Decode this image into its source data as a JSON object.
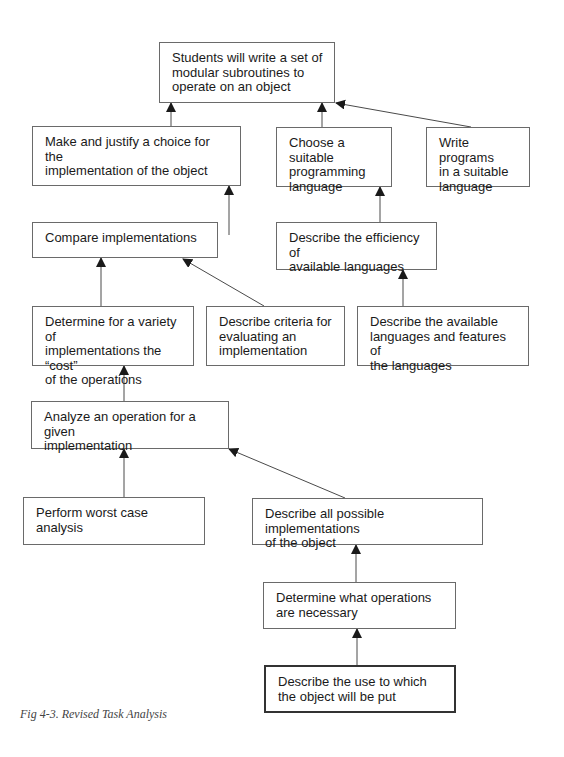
{
  "diagram": {
    "type": "task-analysis-hierarchy",
    "colors": {
      "line": "#4a4a4a",
      "border": "#6a6a6a",
      "text": "#1a1a1a"
    },
    "nodes": [
      {
        "id": "n0",
        "label": "Students will write a set of\nmodular subroutines to\noperate on an object",
        "x": 159,
        "y": 42,
        "w": 176,
        "h": 61
      },
      {
        "id": "n1",
        "label": "Make and justify a choice for the\nimplementation of the object",
        "x": 32,
        "y": 126,
        "w": 209,
        "h": 60
      },
      {
        "id": "n2",
        "label": "Choose a suitable\nprogramming\nlanguage",
        "x": 276,
        "y": 127,
        "w": 116,
        "h": 60
      },
      {
        "id": "n3",
        "label": "Write programs\nin a suitable\nlanguage",
        "x": 426,
        "y": 127,
        "w": 104,
        "h": 60
      },
      {
        "id": "n4",
        "label": "Compare implementations",
        "x": 32,
        "y": 222,
        "w": 186,
        "h": 36
      },
      {
        "id": "n5",
        "label": "Describe the efficiency of\navailable languages",
        "x": 276,
        "y": 222,
        "w": 161,
        "h": 48
      },
      {
        "id": "n6",
        "label": "Determine for a variety of\nimplementations the “cost”\nof the operations",
        "x": 32,
        "y": 306,
        "w": 162,
        "h": 60
      },
      {
        "id": "n7",
        "label": "Describe criteria for\nevaluating an\nimplementation",
        "x": 206,
        "y": 306,
        "w": 139,
        "h": 60
      },
      {
        "id": "n8",
        "label": "Describe the available\nlanguages and features of\nthe languages",
        "x": 357,
        "y": 306,
        "w": 172,
        "h": 60
      },
      {
        "id": "n9",
        "label": "Analyze an operation for a given\nimplementation",
        "x": 31,
        "y": 401,
        "w": 198,
        "h": 48
      },
      {
        "id": "n10",
        "label": "Perform worst case analysis",
        "x": 23,
        "y": 497,
        "w": 182,
        "h": 48
      },
      {
        "id": "n11",
        "label": "Describe all possible implementations\nof the object",
        "x": 252,
        "y": 498,
        "w": 231,
        "h": 47
      },
      {
        "id": "n12",
        "label": "Determine what operations\nare necessary",
        "x": 263,
        "y": 582,
        "w": 193,
        "h": 47
      },
      {
        "id": "n13",
        "label": "Describe the use to which\nthe object will be put",
        "x": 264,
        "y": 665,
        "w": 192,
        "h": 48,
        "emphasis": true
      }
    ],
    "edges": [
      {
        "from": "n1",
        "to": "n0",
        "x1": 171,
        "y1": 126,
        "x2": 171,
        "y2": 103
      },
      {
        "from": "n2",
        "to": "n0",
        "x1": 322,
        "y1": 127,
        "x2": 322,
        "y2": 103
      },
      {
        "from": "n3",
        "to": "n0",
        "x1": 471,
        "y1": 127,
        "x2": 336,
        "y2": 103
      },
      {
        "from": "n4",
        "to": "n1",
        "x1": 229,
        "y1": 235,
        "x2": 229,
        "y2": 186
      },
      {
        "from": "n5",
        "to": "n2",
        "x1": 380,
        "y1": 235,
        "x2": 380,
        "y2": 187
      },
      {
        "from": "n6",
        "to": "n4",
        "x1": 101,
        "y1": 306,
        "x2": 101,
        "y2": 258
      },
      {
        "from": "n7",
        "to": "n4",
        "x1": 264,
        "y1": 306,
        "x2": 183,
        "y2": 259
      },
      {
        "from": "n8",
        "to": "n5",
        "x1": 403,
        "y1": 306,
        "x2": 403,
        "y2": 270
      },
      {
        "from": "n9",
        "to": "n6",
        "x1": 124,
        "y1": 401,
        "x2": 124,
        "y2": 366
      },
      {
        "from": "n10",
        "to": "n9",
        "x1": 124,
        "y1": 497,
        "x2": 124,
        "y2": 449
      },
      {
        "from": "n11",
        "to": "n9",
        "x1": 345,
        "y1": 498,
        "x2": 229,
        "y2": 449
      },
      {
        "from": "n12",
        "to": "n11",
        "x1": 356,
        "y1": 582,
        "x2": 356,
        "y2": 545
      },
      {
        "from": "n13",
        "to": "n12",
        "x1": 357,
        "y1": 665,
        "x2": 357,
        "y2": 629
      }
    ]
  },
  "caption": "Fig 4-3. Revised Task Analysis"
}
